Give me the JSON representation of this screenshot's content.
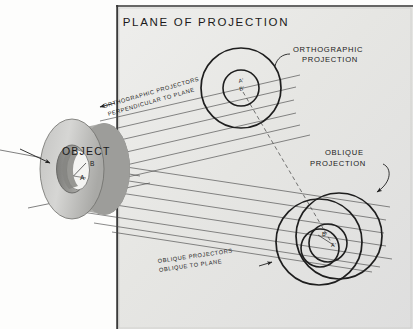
{
  "figure": {
    "title": "PLANE OF PROJECTION",
    "background_color": "#fdfdfc",
    "plane_color": "#e7e7e5",
    "line_color": "#2a2a2a",
    "object_fill": "#c9c9c7",
    "object_shadow": "#8d8d8b"
  },
  "labels": {
    "plane_title": "PLANE OF PROJECTION",
    "orthographic_projection_line1": "ORTHOGRAPHIC",
    "orthographic_projection_line2": "PROJECTION",
    "oblique_projection_line1": "OBLIQUE",
    "oblique_projection_line2": "PROJECTION",
    "orthographic_projectors_line1": "ORTHOGRAPHIC PROJECTORS",
    "orthographic_projectors_line2": "PERPENDICULAR TO PLANE",
    "oblique_projectors_line1": "OBLIQUE PROJECTORS",
    "oblique_projectors_line2": "OBLIQUE TO PLANE",
    "object": "OBJECT"
  },
  "points": {
    "object_a": "A",
    "object_b": "B",
    "ortho_a": "A'",
    "ortho_b": "B'",
    "oblique_a": "A'",
    "oblique_b": "B'"
  }
}
